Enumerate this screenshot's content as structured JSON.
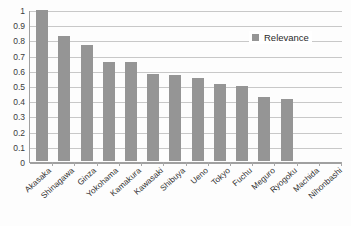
{
  "chart_data": {
    "type": "bar",
    "title": "",
    "xlabel": "",
    "ylabel": "",
    "ylim": [
      0,
      1
    ],
    "ytick_labels": [
      "1",
      "0.9",
      "0.8",
      "0.7",
      "0.6",
      "0.5",
      "0.4",
      "0.3",
      "0.2",
      "0.1",
      "0"
    ],
    "ytick_values": [
      1,
      0.9,
      0.8,
      0.7,
      0.6,
      0.5,
      0.4,
      0.3,
      0.2,
      0.1,
      0
    ],
    "grid": true,
    "legend_position": "top-right-inside",
    "categories": [
      "Akasaka",
      "Shinagawa",
      "Ginza",
      "Yokohama",
      "Kamakura",
      "Kawasaki",
      "Shibuya",
      "Ueno",
      "Tokyo",
      "Fuchu",
      "Meguro",
      "Ryogoku",
      "Machida",
      "Nihonbashi"
    ],
    "series": [
      {
        "name": "Relevance",
        "color": "#959595",
        "values": [
          1.0,
          0.83,
          0.77,
          0.655,
          0.655,
          0.575,
          0.57,
          0.55,
          0.51,
          0.5,
          0.425,
          0.41,
          0,
          0
        ]
      }
    ]
  },
  "legend": {
    "marker": "square-swatch",
    "label": "Relevance"
  },
  "colors": {
    "bar": "#959595",
    "gridline": "#c8c8c8",
    "axis": "#a0a0a0",
    "background": "#fdfdfd",
    "text": "#2e2e2e"
  }
}
